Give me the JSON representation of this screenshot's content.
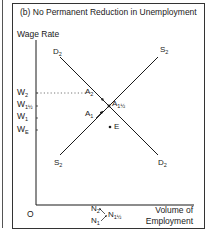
{
  "panel": {
    "title": "(b)   No Permanent Reduction in Unemployment",
    "y_axis_label": "Wage Rate",
    "x_axis_label_line1": "Volume of",
    "x_axis_label_line2": "Employment",
    "origin": "O"
  },
  "wage_labels": [
    {
      "base": "W",
      "sub": "2"
    },
    {
      "base": "W",
      "sub": "1½"
    },
    {
      "base": "W",
      "sub": "1"
    },
    {
      "base": "W",
      "sub": "E"
    }
  ],
  "curves": {
    "demand_top": {
      "base": "D",
      "sub": "2"
    },
    "demand_bottom": {
      "base": "D",
      "sub": "2"
    },
    "supply_top": {
      "base": "S",
      "sub": "2"
    },
    "supply_bottom": {
      "base": "S",
      "sub": "2"
    }
  },
  "points": {
    "a2": {
      "base": "A",
      "sub": "2"
    },
    "a1": {
      "base": "A",
      "sub": "1"
    },
    "a1half": {
      "base": "A",
      "sub": "1½"
    },
    "e": "E"
  },
  "employment_labels": {
    "n2": {
      "base": "N",
      "sub": "2"
    },
    "n1": {
      "base": "N",
      "sub": "1"
    },
    "n1half": {
      "base": "N",
      "sub": "1½"
    }
  },
  "colors": {
    "line": "#1a1a1a",
    "frame": "#333333"
  }
}
